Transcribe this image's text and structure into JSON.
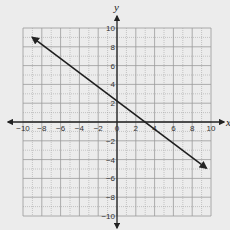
{
  "chart_data": {
    "type": "line",
    "title": "",
    "xlabel": "x",
    "ylabel": "y",
    "xlim": [
      -10,
      10
    ],
    "ylim": [
      -10,
      10
    ],
    "grid": true,
    "grid_step": 1,
    "x_ticks": [
      -10,
      -8,
      -6,
      -4,
      -2,
      0,
      2,
      4,
      6,
      8,
      10
    ],
    "y_ticks": [
      -10,
      -8,
      -6,
      -4,
      -2,
      2,
      4,
      6,
      8,
      10
    ],
    "series": [
      {
        "name": "line",
        "equation": "y = -0.75x + 2.25",
        "x": [
          -9,
          0,
          3,
          9.5
        ],
        "y": [
          9,
          2.25,
          0,
          -4.9
        ],
        "arrows": "both"
      }
    ]
  },
  "colors": {
    "background": "#ececec",
    "grid": "#9a9a9a",
    "axis": "#222222",
    "line": "#1e1e1e"
  }
}
